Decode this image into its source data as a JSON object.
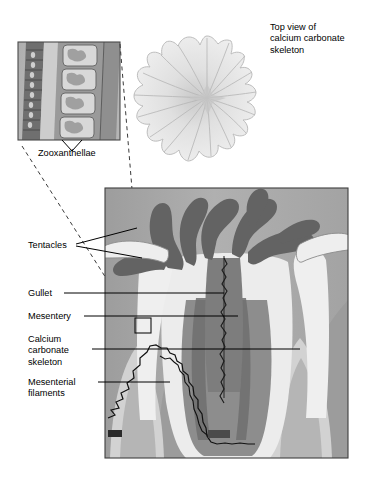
{
  "figure": {
    "background_color": "#ffffff",
    "line_color": "#000000"
  },
  "captions": {
    "top_view": "Top view of\ncalcium carbonate\nskeleton"
  },
  "labels": [
    {
      "id": "zooxanthellae",
      "text": "Zooxanthellae"
    },
    {
      "id": "tentacles",
      "text": "Tentacles"
    },
    {
      "id": "gullet",
      "text": "Gullet"
    },
    {
      "id": "mesentery",
      "text": "Mesentery"
    },
    {
      "id": "calcium_carbonate_skeleton",
      "text": "Calcium\ncarbonate\nskeleton"
    },
    {
      "id": "mesenterial_filaments",
      "text": "Mesenterial\nfilaments"
    }
  ],
  "panels": {
    "inset_tissue": {
      "name": "tissue-cell-inset",
      "x": 18,
      "y": 42,
      "width": 102,
      "height": 98,
      "border_color": "#555555",
      "fill_color": "#b9b9b9",
      "description": "Magnified tissue layers containing zooxanthellae cells"
    },
    "top_view_skeleton": {
      "name": "skeleton-top-view",
      "cx": 207,
      "cy": 98,
      "radius": 62,
      "fill_color": "#e8e8e8",
      "stroke_color": "#c2c2c2",
      "septa_count": 16,
      "lobes": 16
    },
    "main_cross_section": {
      "name": "polyp-cross-section",
      "x": 105,
      "y": 188,
      "width": 243,
      "height": 270,
      "border_color": "#444444",
      "background_color": "#a8a8a8"
    }
  },
  "palette": {
    "frame_bg": "#a8a8a8",
    "tentacle_dark": "#616161",
    "tissue_light": "#efefef",
    "tissue_pale": "#dcdcdc",
    "skeleton_mid": "#b0b0b0",
    "skeleton_light": "#cfcfcf",
    "gullet_dark": "#757575",
    "inset_band_dark": "#6f6f6f",
    "inset_band_mid": "#9a9a9a",
    "inset_cell": "#d6d6d6",
    "leader_line": "#000000",
    "dashed_line": "#3a3a3a"
  }
}
